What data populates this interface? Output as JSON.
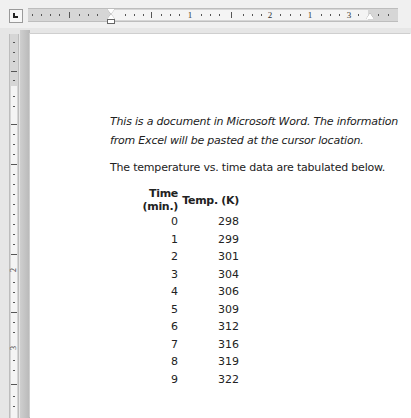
{
  "ruler": {
    "horizontal_numbers": [
      "1",
      "2",
      "1",
      "3"
    ],
    "vertical_numbers": [
      "1",
      "2",
      "3"
    ],
    "tab_selector_icon": "left-tab-icon"
  },
  "document": {
    "intro": "This is a document in Microsoft Word. The information from Excel will be pasted at the cursor location.",
    "lead": "The temperature vs. time data are tabulated below.",
    "table": {
      "headers": [
        "Time (min.)",
        "Temp. (K)"
      ],
      "rows": [
        [
          "0",
          "298"
        ],
        [
          "1",
          "299"
        ],
        [
          "2",
          "301"
        ],
        [
          "3",
          "304"
        ],
        [
          "4",
          "306"
        ],
        [
          "5",
          "309"
        ],
        [
          "6",
          "312"
        ],
        [
          "7",
          "316"
        ],
        [
          "8",
          "319"
        ],
        [
          "9",
          "322"
        ]
      ]
    },
    "closing": "As you can see in the table above..."
  }
}
